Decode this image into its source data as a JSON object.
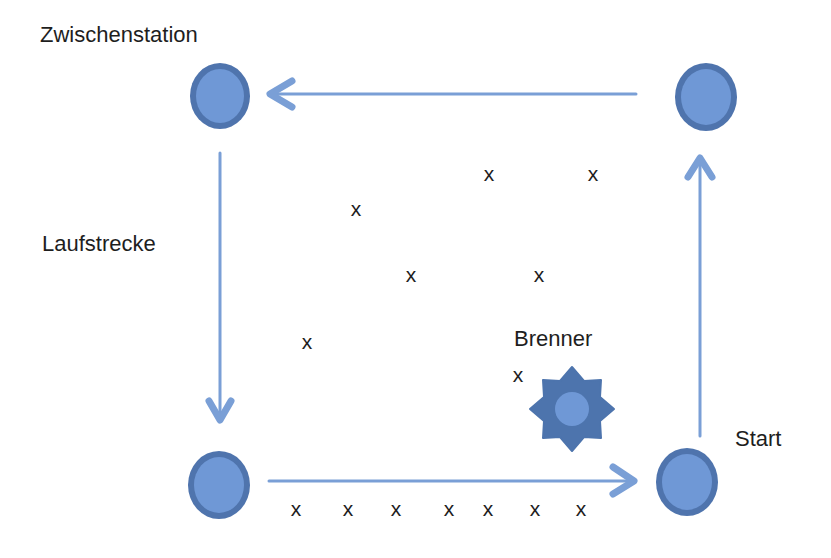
{
  "labels": {
    "zwischenstation": "Zwischenstation",
    "laufstrecke": "Laufstrecke",
    "brenner": "Brenner",
    "start": "Start"
  },
  "colors": {
    "station_fill": "#6f98d6",
    "station_ring": "#4f74ad",
    "arrow": "#7a9fd6",
    "burner_star": "#4d74ad",
    "burner_center": "#6f98d6",
    "text": "#1e1e1e"
  },
  "stations": [
    {
      "name": "zwischenstation",
      "cx": 220,
      "cy": 96
    },
    {
      "name": "top-right",
      "cx": 706,
      "cy": 96
    },
    {
      "name": "bottom-left",
      "cx": 218,
      "cy": 485
    },
    {
      "name": "start",
      "cx": 686,
      "cy": 482
    }
  ],
  "arrows": [
    {
      "name": "top-arrow-left",
      "direction": "left"
    },
    {
      "name": "left-arrow-down",
      "direction": "down"
    },
    {
      "name": "bottom-arrow-right",
      "direction": "right"
    },
    {
      "name": "right-arrow-up",
      "direction": "up"
    }
  ],
  "marks": [
    {
      "text": "x",
      "x": 489,
      "y": 173
    },
    {
      "text": "x",
      "x": 593,
      "y": 173
    },
    {
      "text": "x",
      "x": 356,
      "y": 208
    },
    {
      "text": "x",
      "x": 411,
      "y": 274
    },
    {
      "text": "x",
      "x": 539,
      "y": 274
    },
    {
      "text": "x",
      "x": 307,
      "y": 341
    },
    {
      "text": "x",
      "x": 518,
      "y": 374
    },
    {
      "text": "x",
      "x": 296,
      "y": 508
    },
    {
      "text": "x",
      "x": 348,
      "y": 508
    },
    {
      "text": "x",
      "x": 396,
      "y": 508
    },
    {
      "text": "x",
      "x": 449,
      "y": 508
    },
    {
      "text": "x",
      "x": 488,
      "y": 508
    },
    {
      "text": "x",
      "x": 535,
      "y": 508
    },
    {
      "text": "x",
      "x": 581,
      "y": 508
    }
  ]
}
